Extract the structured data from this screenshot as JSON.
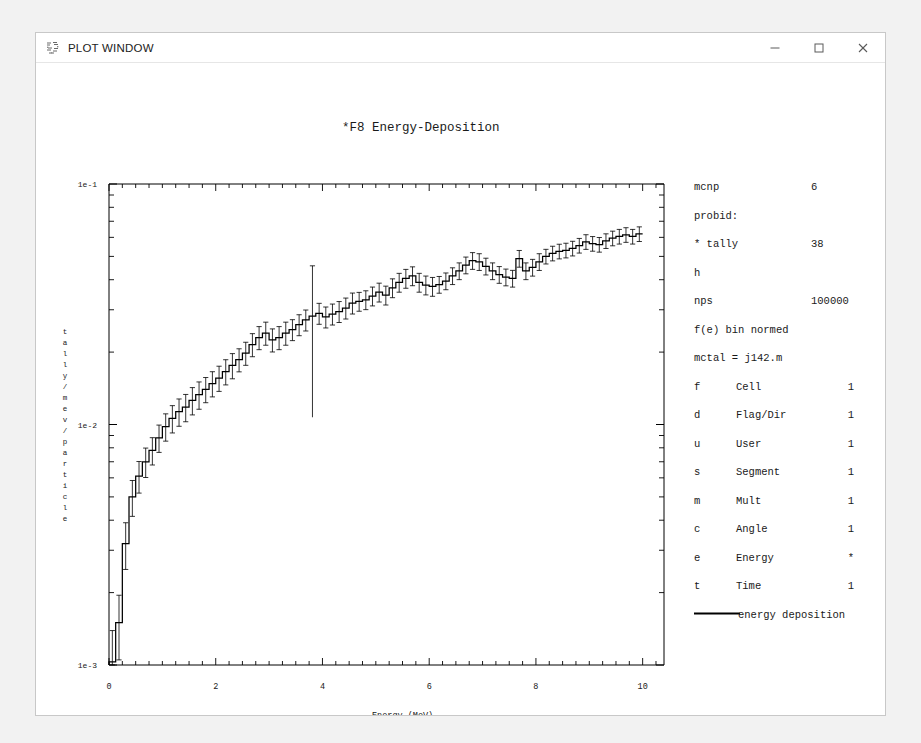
{
  "window": {
    "title": "PLOT WINDOW",
    "icon": "mcnp-plot-icon",
    "controls": {
      "minimize_label": "–",
      "maximize_label": "□",
      "close_label": "×"
    }
  },
  "plot": {
    "title": "*F8 Energy-Deposition",
    "xlabel": "Energy (MeV)",
    "ylabel": "tally/mev/particle",
    "ylabel_chars": [
      "t",
      "a",
      "l",
      "l",
      "y",
      "/",
      "m",
      "e",
      "v",
      "/",
      "p",
      "a",
      "r",
      "t",
      "i",
      "c",
      "l",
      "e"
    ],
    "line_color": "#000000",
    "axis_color": "#000000",
    "text_color": "#1a1a1a"
  },
  "legend_panel": {
    "rows": [
      {
        "key": "mcnp",
        "label": "",
        "value": "6"
      },
      {
        "key": "probid:",
        "label": "",
        "value": ""
      },
      {
        "key": "* tally",
        "label": "",
        "value": "38"
      },
      {
        "key": "h",
        "label": "",
        "value": ""
      },
      {
        "key": "nps",
        "label": "",
        "value": "100000"
      },
      {
        "key": "f(e) bin normed",
        "label": "",
        "value": ""
      },
      {
        "key": "mctal = j142.m",
        "label": "",
        "value": ""
      }
    ],
    "bins": [
      {
        "key": "f",
        "label": "Cell",
        "value": "1"
      },
      {
        "key": "d",
        "label": "Flag/Dir",
        "value": "1"
      },
      {
        "key": "u",
        "label": "User",
        "value": "1"
      },
      {
        "key": "s",
        "label": "Segment",
        "value": "1"
      },
      {
        "key": "m",
        "label": "Mult",
        "value": "1"
      },
      {
        "key": "c",
        "label": "Angle",
        "value": "1"
      },
      {
        "key": "e",
        "label": "Energy",
        "value": "*"
      },
      {
        "key": "t",
        "label": "Time",
        "value": "1"
      }
    ],
    "series_legend": {
      "swatch": "solid-line-swatch",
      "label": "energy deposition"
    }
  },
  "chart_data": {
    "type": "line",
    "subtype": "histogram-step-with-errorbars",
    "title": "*F8 Energy-Deposition",
    "xlabel": "Energy (MeV)",
    "ylabel": "tally/mev/particle",
    "xscale": "linear",
    "yscale": "log",
    "xlim": [
      0,
      10.4
    ],
    "ylim": [
      0.001,
      0.1
    ],
    "xticks": [
      0,
      2,
      4,
      6,
      8,
      10
    ],
    "xtick_labels": [
      "0",
      "2",
      "4",
      "6",
      "8",
      "10"
    ],
    "xminor_step": 0.25,
    "yticks": [
      0.001,
      0.01,
      0.1
    ],
    "ytick_labels": [
      "1e-3",
      "1e-2",
      "1e-1"
    ],
    "grid": false,
    "legend_position": "right",
    "series": [
      {
        "name": "energy deposition",
        "color": "#000000",
        "bin_width": 0.125,
        "x": [
          0.0625,
          0.1875,
          0.3125,
          0.4375,
          0.5625,
          0.6875,
          0.8125,
          0.9375,
          1.0625,
          1.1875,
          1.3125,
          1.4375,
          1.5625,
          1.6875,
          1.8125,
          1.9375,
          2.0625,
          2.1875,
          2.3125,
          2.4375,
          2.5625,
          2.6875,
          2.8125,
          2.9375,
          3.0625,
          3.1875,
          3.3125,
          3.4375,
          3.5625,
          3.6875,
          3.8125,
          3.9375,
          4.0625,
          4.1875,
          4.3125,
          4.4375,
          4.5625,
          4.6875,
          4.8125,
          4.9375,
          5.0625,
          5.1875,
          5.3125,
          5.4375,
          5.5625,
          5.6875,
          5.8125,
          5.9375,
          6.0625,
          6.1875,
          6.3125,
          6.4375,
          6.5625,
          6.6875,
          6.8125,
          6.9375,
          7.0625,
          7.1875,
          7.3125,
          7.4375,
          7.5625,
          7.6875,
          7.8125,
          7.9375,
          8.0625,
          8.1875,
          8.3125,
          8.4375,
          8.5625,
          8.6875,
          8.8125,
          8.9375,
          9.0625,
          9.1875,
          9.3125,
          9.4375,
          9.5625,
          9.6875,
          9.8125,
          9.9375
        ],
        "y": [
          0.00103,
          0.0015,
          0.0032,
          0.005,
          0.0061,
          0.007,
          0.0078,
          0.0088,
          0.0098,
          0.0106,
          0.0113,
          0.0118,
          0.0126,
          0.0133,
          0.014,
          0.0148,
          0.0156,
          0.0166,
          0.0176,
          0.0186,
          0.0198,
          0.0215,
          0.023,
          0.024,
          0.0225,
          0.023,
          0.024,
          0.0248,
          0.026,
          0.0272,
          0.0282,
          0.029,
          0.028,
          0.0288,
          0.0295,
          0.0305,
          0.032,
          0.0325,
          0.033,
          0.0342,
          0.0355,
          0.0345,
          0.037,
          0.039,
          0.0405,
          0.0415,
          0.039,
          0.038,
          0.0375,
          0.0382,
          0.0395,
          0.0415,
          0.0435,
          0.046,
          0.048,
          0.0475,
          0.0455,
          0.0435,
          0.042,
          0.041,
          0.0405,
          0.049,
          0.0435,
          0.045,
          0.0475,
          0.05,
          0.0515,
          0.0525,
          0.053,
          0.054,
          0.0555,
          0.0575,
          0.0565,
          0.056,
          0.058,
          0.0595,
          0.0605,
          0.0615,
          0.0605,
          0.062
        ],
        "yerr_rel": [
          0.35,
          0.3,
          0.22,
          0.17,
          0.15,
          0.14,
          0.13,
          0.13,
          0.13,
          0.13,
          0.13,
          0.13,
          0.13,
          0.13,
          0.12,
          0.12,
          0.12,
          0.12,
          0.12,
          0.11,
          0.11,
          0.11,
          0.11,
          0.11,
          0.11,
          0.11,
          0.11,
          0.1,
          0.1,
          0.1,
          0.62,
          0.1,
          0.1,
          0.1,
          0.1,
          0.1,
          0.1,
          0.09,
          0.09,
          0.09,
          0.09,
          0.09,
          0.09,
          0.09,
          0.09,
          0.09,
          0.09,
          0.09,
          0.09,
          0.08,
          0.08,
          0.08,
          0.08,
          0.08,
          0.08,
          0.08,
          0.08,
          0.08,
          0.08,
          0.08,
          0.08,
          0.08,
          0.08,
          0.08,
          0.08,
          0.07,
          0.07,
          0.07,
          0.07,
          0.07,
          0.07,
          0.07,
          0.07,
          0.07,
          0.07,
          0.07,
          0.07,
          0.07,
          0.07,
          0.07
        ]
      }
    ]
  }
}
